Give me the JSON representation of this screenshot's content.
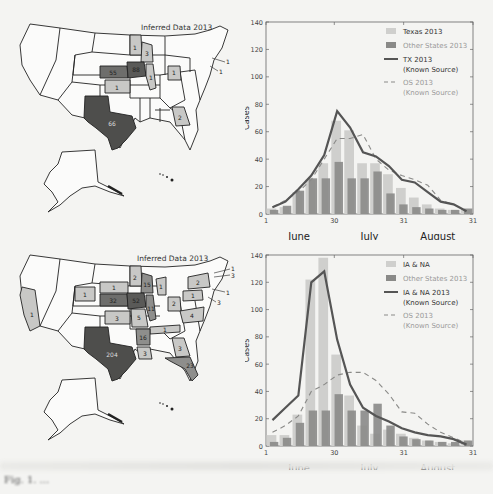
{
  "maps": [
    {
      "title": "Inferred Data 2013",
      "states": [
        {
          "state": "Minnesota",
          "value": 1,
          "shade": "light"
        },
        {
          "state": "Wisconsin",
          "value": 3,
          "shade": "light"
        },
        {
          "state": "Nebraska",
          "value": 55,
          "shade": "dark"
        },
        {
          "state": "Iowa",
          "value": 88,
          "shade": "dark"
        },
        {
          "state": "Illinois",
          "value": 1,
          "shade": "light"
        },
        {
          "state": "Ohio",
          "value": 1,
          "shade": "light"
        },
        {
          "state": "Kansas",
          "value": 1,
          "shade": "light"
        },
        {
          "state": "Georgia",
          "value": 2,
          "shade": "light"
        },
        {
          "state": "Texas",
          "value": 66,
          "shade": "dark"
        },
        {
          "state": "Connecticut",
          "value": 1,
          "shade": "callout"
        },
        {
          "state": "New Jersey",
          "value": 1,
          "shade": "callout"
        }
      ]
    },
    {
      "title": "Inferred Data 2013",
      "states": [
        {
          "state": "California",
          "value": 1,
          "shade": "light"
        },
        {
          "state": "Wyoming",
          "value": 1,
          "shade": "light"
        },
        {
          "state": "South Dakota",
          "value": 1,
          "shade": "light"
        },
        {
          "state": "Minnesota",
          "value": 2,
          "shade": "light"
        },
        {
          "state": "Wisconsin",
          "value": 15,
          "shade": "medium"
        },
        {
          "state": "Michigan",
          "value": 1,
          "shade": "light"
        },
        {
          "state": "Nebraska",
          "value": 32,
          "shade": "dark"
        },
        {
          "state": "Iowa",
          "value": 52,
          "shade": "dark"
        },
        {
          "state": "Illinois",
          "value": 11,
          "shade": "medium"
        },
        {
          "state": "Kansas",
          "value": 3,
          "shade": "light"
        },
        {
          "state": "Missouri",
          "value": 5,
          "shade": "light"
        },
        {
          "state": "Ohio",
          "value": 2,
          "shade": "light"
        },
        {
          "state": "Pennsylvania",
          "value": 1,
          "shade": "light"
        },
        {
          "state": "New York",
          "value": 2,
          "shade": "light"
        },
        {
          "state": "Virginia",
          "value": 4,
          "shade": "light"
        },
        {
          "state": "Tennessee",
          "value": 1,
          "shade": "light"
        },
        {
          "state": "Arkansas",
          "value": 16,
          "shade": "medium"
        },
        {
          "state": "Louisiana",
          "value": 3,
          "shade": "light"
        },
        {
          "state": "Georgia",
          "value": 3,
          "shade": "light"
        },
        {
          "state": "Florida",
          "value": 23,
          "shade": "medium"
        },
        {
          "state": "Texas",
          "value": 204,
          "shade": "dark"
        },
        {
          "state": "New Hampshire",
          "value": 1,
          "shade": "callout"
        },
        {
          "state": "Massachusetts",
          "value": 3,
          "shade": "callout"
        },
        {
          "state": "Connecticut",
          "value": 1,
          "shade": "callout"
        },
        {
          "state": "New Jersey",
          "value": 3,
          "shade": "callout"
        }
      ]
    }
  ],
  "chart_data": [
    {
      "type": "bar",
      "title": "",
      "xlabel": "",
      "ylabel": "Cases",
      "ylim": [
        0,
        140
      ],
      "yticks": [
        0,
        20,
        40,
        60,
        80,
        100,
        120,
        140
      ],
      "xtick_labels": [
        "1",
        "30",
        "31",
        "31"
      ],
      "month_labels": [
        "June",
        "July",
        "August"
      ],
      "grid": false,
      "legend_position": "upper right",
      "legend": [
        "Texas 2013",
        "Other States 2013",
        "TX 2013 (Known Source)",
        "OS 2013 (Known Source)"
      ],
      "categories": [
        "W1",
        "W2",
        "W3",
        "W4",
        "W5",
        "W6",
        "W7",
        "W8",
        "W9",
        "W10",
        "W11",
        "W12",
        "W13",
        "W14",
        "W15",
        "W16"
      ],
      "series": [
        {
          "name": "Texas 2013",
          "kind": "bar",
          "values": [
            4,
            5,
            16,
            25,
            37,
            68,
            61,
            37,
            37,
            29,
            19,
            12,
            7,
            4,
            3,
            3
          ]
        },
        {
          "name": "Other States 2013",
          "kind": "bar",
          "values": [
            3,
            6,
            17,
            26,
            26,
            38,
            26,
            26,
            31,
            15,
            7,
            5,
            4,
            3,
            3,
            4
          ]
        },
        {
          "name": "TX 2013 (Known Source)",
          "kind": "line",
          "style": "solid",
          "values": [
            5,
            9,
            18,
            28,
            43,
            75,
            63,
            45,
            42,
            35,
            25,
            23,
            16,
            9,
            7,
            2
          ]
        },
        {
          "name": "OS 2013 (Known Source)",
          "kind": "line",
          "style": "dashed",
          "values": [
            5,
            10,
            16,
            25,
            40,
            55,
            55,
            58,
            40,
            32,
            28,
            25,
            21,
            10,
            7,
            2
          ]
        }
      ]
    },
    {
      "type": "bar",
      "title": "",
      "xlabel": "",
      "ylabel": "Cases",
      "ylim": [
        0,
        140
      ],
      "yticks": [
        0,
        20,
        40,
        60,
        80,
        100,
        120,
        140
      ],
      "xtick_labels": [
        "1",
        "30",
        "31",
        "31"
      ],
      "month_labels": [
        "June",
        "July",
        "August"
      ],
      "grid": false,
      "legend_position": "upper right",
      "legend": [
        "IA & NA",
        "Other States 2013",
        "IA & NA 2013 (Known Source)",
        "OS 2013 (Known Source)"
      ],
      "categories": [
        "W1",
        "W2",
        "W3",
        "W4",
        "W5",
        "W6",
        "W7",
        "W8",
        "W9",
        "W10",
        "W11",
        "W12",
        "W13",
        "W14",
        "W15",
        "W16"
      ],
      "series": [
        {
          "name": "IA & NA",
          "kind": "bar",
          "values": [
            8,
            8,
            23,
            122,
            138,
            67,
            37,
            15,
            9,
            12,
            9,
            6,
            4,
            3,
            2,
            4
          ]
        },
        {
          "name": "Other States 2013",
          "kind": "bar",
          "values": [
            3,
            6,
            17,
            26,
            26,
            38,
            26,
            26,
            31,
            15,
            7,
            5,
            4,
            3,
            3,
            4
          ]
        },
        {
          "name": "IA & NA 2013 (Known Source)",
          "kind": "line",
          "style": "solid",
          "values": [
            19,
            28,
            37,
            120,
            128,
            78,
            45,
            28,
            22,
            18,
            13,
            10,
            8,
            7,
            5,
            1
          ]
        },
        {
          "name": "OS 2013 (Known Source)",
          "kind": "line",
          "style": "dashed",
          "values": [
            10,
            15,
            22,
            40,
            45,
            52,
            54,
            54,
            48,
            38,
            25,
            24,
            16,
            10,
            6,
            2
          ]
        }
      ]
    }
  ],
  "caption": "Fig. 1. ..."
}
